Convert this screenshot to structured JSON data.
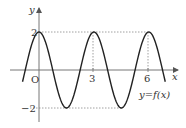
{
  "chart_data": {
    "type": "line",
    "title": "",
    "xlabel": "x",
    "ylabel": "y",
    "function_label": "y=f(x)",
    "origin_label": "O",
    "x_ticks": [
      3,
      6
    ],
    "x_tick_labels": [
      "3",
      "6"
    ],
    "y_ticks": [
      2,
      -2
    ],
    "y_tick_labels": [
      "2",
      "-2"
    ],
    "xlim": [
      -1.5,
      7.5
    ],
    "ylim": [
      -2.5,
      2.5
    ],
    "grid": false,
    "guide_lines": "dotted lines at y=2 and y=-2 and vertical dotted lines at x=3 and x=6",
    "period": 3,
    "amplitude": 2,
    "series": [
      {
        "name": "y=f(x)",
        "formula": "2cos(2πx/3)",
        "x": [
          -0.9,
          0,
          0.75,
          1.5,
          2.25,
          3,
          3.75,
          4.5,
          5.25,
          6,
          6.9
        ],
        "values": [
          -0.86,
          2,
          0,
          -2,
          0,
          2,
          0,
          -2,
          0,
          2,
          -0.86
        ]
      }
    ]
  }
}
